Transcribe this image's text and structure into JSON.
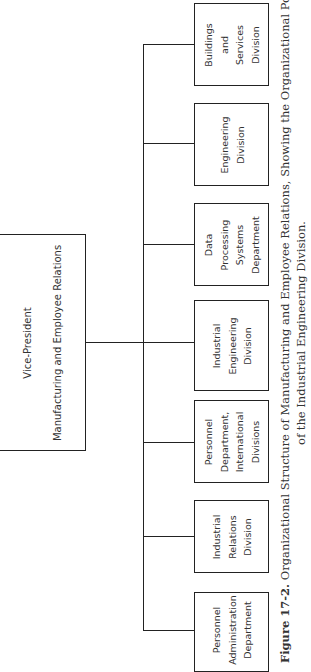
{
  "chart": {
    "top": {
      "title": "Vice-President",
      "subtitle": "Manufacturing and Employee Relations"
    },
    "children": [
      {
        "lines": [
          "Buildings",
          "and",
          "Services",
          "Division"
        ]
      },
      {
        "lines": [
          "Engineering",
          "Division"
        ]
      },
      {
        "lines": [
          "Data",
          "Processing",
          "Systems",
          "Department"
        ]
      },
      {
        "lines": [
          "Industrial",
          "Engineering",
          "Division"
        ]
      },
      {
        "lines": [
          "Personnel",
          "Department,",
          "International",
          "Divisions"
        ]
      },
      {
        "lines": [
          "Industrial",
          "Relations",
          "Division"
        ]
      },
      {
        "lines": [
          "Personnel",
          "Administration",
          "Department"
        ]
      }
    ]
  },
  "caption": {
    "label": "Figure 17-2.",
    "line1": "Organizational Structure of Manufacturing and Employee Relations, Showing the Organizational Position",
    "line2": "of the Industrial Engineering Division."
  },
  "colors": {
    "line": "#222222",
    "text": "#333333",
    "background": "#ffffff"
  }
}
